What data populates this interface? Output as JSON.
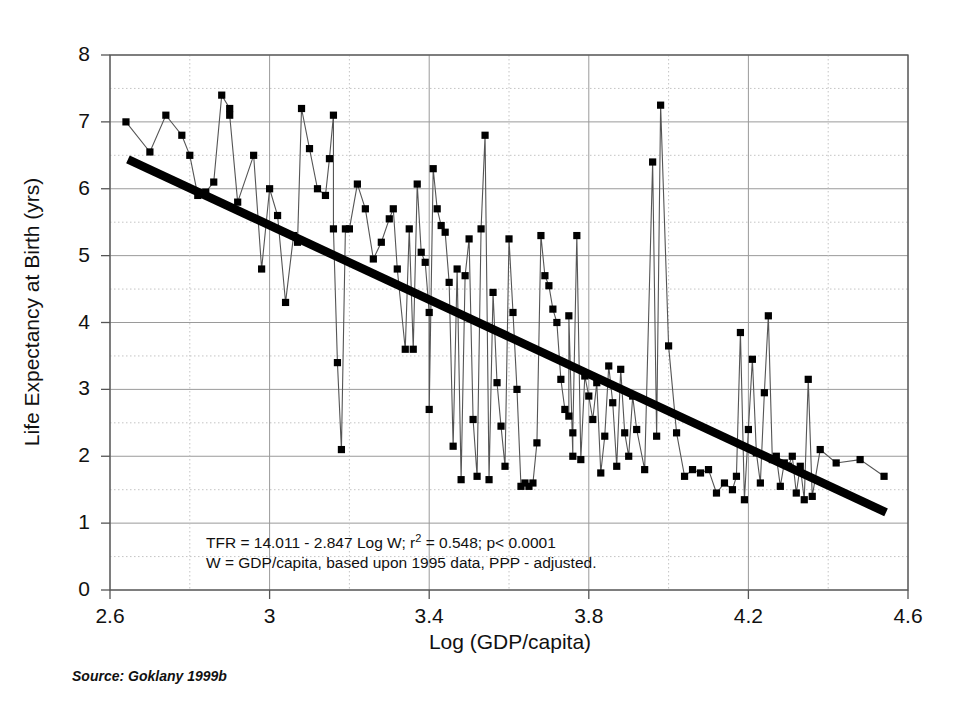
{
  "chart_data": {
    "type": "scatter",
    "title": "",
    "xlabel": "Log (GDP/capita)",
    "ylabel": "Life Expectancy at Birth (yrs)",
    "xlim": [
      2.6,
      4.6
    ],
    "ylim": [
      0,
      8
    ],
    "xticks": [
      "2.6",
      "3",
      "3.4",
      "3.8",
      "4.2",
      "4.6"
    ],
    "xtick_values": [
      2.6,
      3.0,
      3.4,
      3.8,
      4.2,
      4.6
    ],
    "yticks": [
      "0",
      "1",
      "2",
      "3",
      "4",
      "5",
      "6",
      "7",
      "8"
    ],
    "ytick_values": [
      0,
      1,
      2,
      3,
      4,
      5,
      6,
      7,
      8
    ],
    "grid": "major solid + minor dotted, both axes",
    "legend": "none",
    "marker": "filled square, connected by thin line",
    "annotations": [
      "TFR = 14.011 - 2.847 Log W; r2 = 0.548; p< 0.0001",
      "W = GDP/capita, based upon 1995 data, PPP - adjusted."
    ],
    "trendline": {
      "type": "linear",
      "intercept": 14.011,
      "slope": -2.847,
      "x_start": 2.645,
      "y_start": 6.44,
      "x_end": 4.545,
      "y_end": 1.16,
      "style": "thick solid black"
    },
    "x": [
      2.64,
      2.7,
      2.74,
      2.78,
      2.8,
      2.82,
      2.84,
      2.86,
      2.88,
      2.9,
      2.9,
      2.92,
      2.96,
      2.98,
      3.0,
      3.02,
      3.04,
      3.06,
      3.07,
      3.08,
      3.1,
      3.12,
      3.14,
      3.15,
      3.16,
      3.16,
      3.17,
      3.18,
      3.19,
      3.2,
      3.22,
      3.24,
      3.26,
      3.28,
      3.3,
      3.31,
      3.32,
      3.34,
      3.35,
      3.36,
      3.37,
      3.38,
      3.39,
      3.4,
      3.4,
      3.41,
      3.42,
      3.43,
      3.44,
      3.45,
      3.46,
      3.47,
      3.48,
      3.49,
      3.5,
      3.51,
      3.52,
      3.53,
      3.54,
      3.55,
      3.56,
      3.57,
      3.58,
      3.59,
      3.6,
      3.61,
      3.62,
      3.63,
      3.64,
      3.65,
      3.66,
      3.67,
      3.68,
      3.69,
      3.7,
      3.71,
      3.72,
      3.73,
      3.74,
      3.75,
      3.75,
      3.76,
      3.76,
      3.77,
      3.78,
      3.79,
      3.8,
      3.81,
      3.82,
      3.83,
      3.84,
      3.85,
      3.86,
      3.87,
      3.88,
      3.89,
      3.9,
      3.91,
      3.92,
      3.94,
      3.96,
      3.97,
      3.98,
      4.0,
      4.02,
      4.04,
      4.06,
      4.08,
      4.1,
      4.12,
      4.14,
      4.16,
      4.17,
      4.18,
      4.19,
      4.2,
      4.21,
      4.22,
      4.23,
      4.24,
      4.25,
      4.26,
      4.27,
      4.28,
      4.29,
      4.3,
      4.31,
      4.32,
      4.33,
      4.34,
      4.35,
      4.36,
      4.38,
      4.42,
      4.48,
      4.54
    ],
    "y": [
      7.0,
      6.55,
      7.1,
      6.8,
      6.5,
      5.9,
      5.95,
      6.1,
      7.4,
      7.2,
      7.1,
      5.8,
      6.5,
      4.8,
      6.0,
      5.6,
      4.3,
      5.3,
      5.2,
      7.2,
      6.6,
      6.0,
      5.9,
      6.45,
      7.1,
      5.4,
      3.4,
      2.1,
      5.4,
      5.4,
      6.07,
      5.7,
      4.95,
      5.2,
      5.55,
      5.7,
      4.8,
      3.6,
      5.4,
      3.6,
      6.07,
      5.05,
      4.9,
      4.15,
      2.7,
      6.3,
      5.7,
      5.45,
      5.35,
      4.6,
      2.15,
      4.8,
      1.65,
      4.7,
      5.25,
      2.55,
      1.7,
      5.4,
      6.8,
      1.65,
      4.45,
      3.1,
      2.45,
      1.85,
      5.25,
      4.15,
      3.0,
      1.55,
      1.6,
      1.55,
      1.6,
      2.2,
      5.3,
      4.7,
      4.55,
      4.2,
      4.0,
      3.15,
      2.7,
      2.6,
      4.1,
      2.0,
      2.35,
      5.3,
      1.95,
      3.2,
      2.9,
      2.55,
      3.1,
      1.75,
      2.3,
      3.35,
      2.8,
      1.85,
      3.3,
      2.35,
      2.0,
      2.9,
      2.4,
      1.8,
      6.4,
      2.3,
      7.25,
      3.65,
      2.35,
      1.7,
      1.8,
      1.75,
      1.8,
      1.45,
      1.6,
      1.5,
      1.7,
      3.85,
      1.35,
      2.4,
      3.45,
      2.05,
      1.6,
      2.95,
      4.1,
      1.95,
      2.0,
      1.55,
      1.9,
      1.85,
      2.0,
      1.45,
      1.85,
      1.35,
      3.15,
      1.4,
      2.1,
      1.9,
      1.95,
      1.7
    ]
  },
  "axis": {
    "y_title": "Life Expectancy at Birth (yrs)",
    "x_title": "Log (GDP/capita)"
  },
  "annotation": {
    "line1_prefix": "TFR = 14.011 - 2.847 Log W; r",
    "line1_sup": "2",
    "line1_suffix": " = 0.548; p< 0.0001",
    "line2": "W = GDP/capita, based upon 1995 data, PPP - adjusted."
  },
  "source": {
    "text": "Source: Goklany 1999b"
  },
  "colors": {
    "marker": "#000000",
    "line": "#555555",
    "trend": "#000000",
    "grid_major": "#9a9a9a",
    "grid_minor": "#bdbdbd",
    "axis": "#555555",
    "text": "#111111"
  }
}
